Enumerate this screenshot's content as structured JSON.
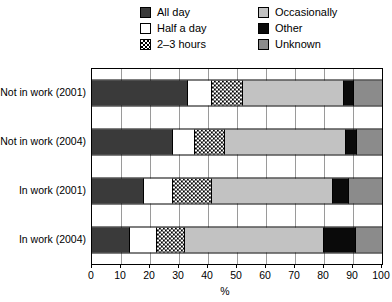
{
  "chart_data": {
    "type": "bar",
    "orientation": "horizontal",
    "stacked": true,
    "title": "",
    "xlabel": "%",
    "ylabel": "",
    "xlim": [
      0,
      100
    ],
    "xticks": [
      0,
      10,
      20,
      30,
      40,
      50,
      60,
      70,
      80,
      90,
      100
    ],
    "grid": true,
    "legend_position": "top",
    "categories": [
      "Not in work (2001)",
      "Not in work (2004)",
      "In work (2001)",
      "In work (2004)"
    ],
    "series": [
      {
        "name": "All day",
        "key": "allday",
        "color": "#3a3a3a",
        "pattern": "solid",
        "values": [
          33,
          28,
          18,
          13
        ]
      },
      {
        "name": "Half a day",
        "key": "half",
        "color": "#ffffff",
        "pattern": "solid",
        "values": [
          8.5,
          7.5,
          10,
          9.5
        ]
      },
      {
        "name": "2–3 hours",
        "key": "hours",
        "color": "#ffffff",
        "pattern": "checkerboard",
        "values": [
          10.5,
          10.5,
          13.5,
          9.5
        ]
      },
      {
        "name": "Occasionally",
        "key": "occ",
        "color": "#c2c2c2",
        "pattern": "solid",
        "values": [
          35,
          41.5,
          41.5,
          48
        ]
      },
      {
        "name": "Other",
        "key": "other",
        "color": "#0a0a0a",
        "pattern": "solid",
        "values": [
          3.5,
          4,
          5.5,
          11
        ]
      },
      {
        "name": "Unknown",
        "key": "unknown",
        "color": "#8b8b8b",
        "pattern": "solid",
        "values": [
          9.5,
          8.5,
          11.5,
          9
        ]
      }
    ]
  },
  "legend": {
    "items": [
      {
        "label": "All day",
        "swatch": "fill-allday"
      },
      {
        "label": "Occasionally",
        "swatch": "fill-occ"
      },
      {
        "label": "Half a day",
        "swatch": "fill-half"
      },
      {
        "label": "Other",
        "swatch": "fill-other"
      },
      {
        "label": "2–3 hours",
        "swatch": "fill-hours"
      },
      {
        "label": "Unknown",
        "swatch": "fill-unknown"
      }
    ]
  }
}
